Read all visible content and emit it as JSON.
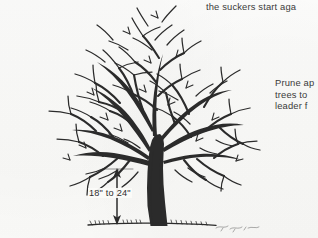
{
  "page": {
    "kind": "scanned-book-illustration",
    "background_color": "#fbfbf9",
    "ink_color": "#2b2b2b",
    "text_color": "#3a3a3a"
  },
  "captions": {
    "top": "the suckers start aga",
    "right": {
      "line1": "Prune ap",
      "line2": "trees to",
      "line3": "leader f"
    }
  },
  "dimension": {
    "label": "18\" to 24\"",
    "min": "18\"",
    "max": "24\"",
    "connector": "to",
    "measures": "trunk clearance from ground to lowest scaffold branch",
    "arrow_style": "double-headed-vertical"
  },
  "illustration": {
    "ground_line_label": "ground",
    "trunk_label": "trunk",
    "canopy_label": "bare branch canopy"
  }
}
